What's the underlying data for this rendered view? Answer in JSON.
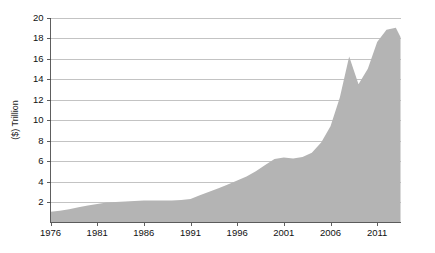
{
  "chart_data": {
    "type": "area",
    "title": "",
    "subtitle": "",
    "xlabel": "",
    "ylabel": "($) Trillion",
    "xlim": [
      1976,
      2013.5
    ],
    "ylim": [
      0,
      20
    ],
    "grid": true,
    "legend": false,
    "legend_position": "none",
    "series_color": "#b4b4b4",
    "grid_color": "#a9a9a9",
    "axis_color": "#4d4d4d",
    "ytick_labels": [
      "2",
      "4",
      "6",
      "8",
      "10",
      "12",
      "14",
      "16",
      "18",
      "20"
    ],
    "ytick_values": [
      2,
      4,
      6,
      8,
      10,
      12,
      14,
      16,
      18,
      20
    ],
    "xtick_labels": [
      "1976",
      "1981",
      "1986",
      "1991",
      "1996",
      "2001",
      "2006",
      "2011"
    ],
    "xtick_values": [
      1976,
      1981,
      1986,
      1991,
      1996,
      2001,
      2006,
      2011
    ],
    "x": [
      1976,
      1977,
      1978,
      1979,
      1980,
      1981,
      1982,
      1983,
      1984,
      1985,
      1986,
      1987,
      1988,
      1989,
      1990,
      1991,
      1992,
      1993,
      1994,
      1995,
      1996,
      1997,
      1998,
      1999,
      2000,
      2001,
      2002,
      2003,
      2004,
      2005,
      2006,
      2007,
      2008,
      2009,
      2010,
      2011,
      2012,
      2013,
      2013.5
    ],
    "values": [
      1.05,
      1.15,
      1.3,
      1.5,
      1.65,
      1.8,
      1.95,
      2.0,
      2.05,
      2.1,
      2.15,
      2.15,
      2.15,
      2.15,
      2.2,
      2.3,
      2.65,
      3.0,
      3.35,
      3.7,
      4.1,
      4.5,
      5.0,
      5.6,
      6.2,
      6.35,
      6.25,
      6.4,
      6.8,
      7.8,
      9.4,
      12.2,
      16.2,
      13.5,
      15.0,
      17.6,
      18.8,
      19.0,
      18.1
    ]
  },
  "axis": {
    "ylabel": "($) Trillion"
  }
}
